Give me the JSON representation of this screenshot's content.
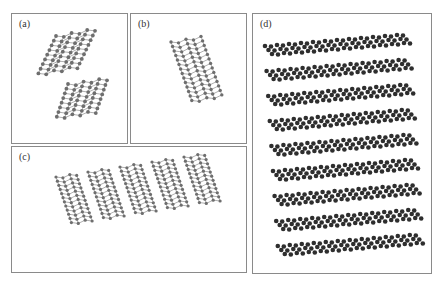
{
  "figure": {
    "panels": [
      {
        "id": "a",
        "label": "(a)",
        "description": "Single curved graphene sheet (partially folded)"
      },
      {
        "id": "b",
        "label": "(b)",
        "description": "Curved graphene sheet viewed edge-on"
      },
      {
        "id": "c",
        "label": "(c)",
        "description": "Five stacked curved graphene sheets"
      },
      {
        "id": "d",
        "label": "(d)",
        "description": "Multilayer stacked graphene sheets (9 layers)"
      }
    ],
    "colors": {
      "atom": "#6e6e6e",
      "atom_dark": "#2e2e2e",
      "bond": "#9a9a9a",
      "border": "#8a8a8a"
    }
  }
}
